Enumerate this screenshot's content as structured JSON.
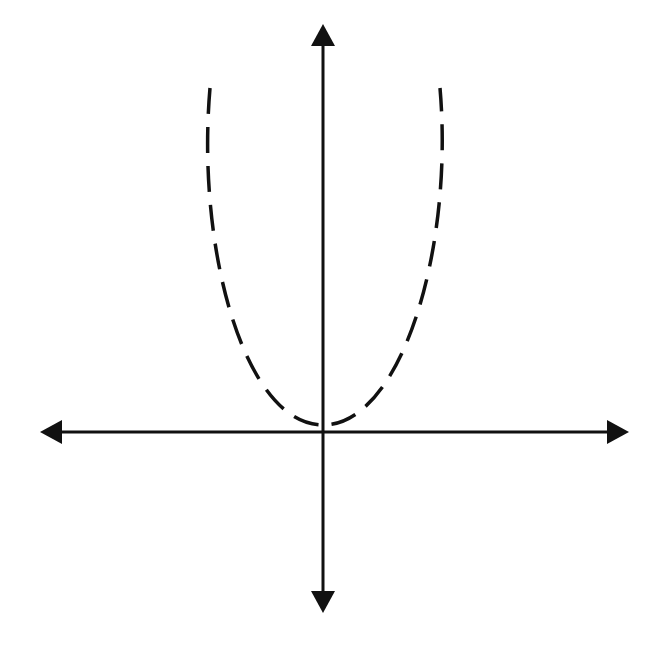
{
  "diagram": {
    "type": "coordinate-plane-graph",
    "colors": {
      "background": "#ffffff",
      "ink": "#111111"
    },
    "axes": {
      "x_axis": {
        "y": 432,
        "x_start": 40,
        "x_end": 628,
        "arrows": "both"
      },
      "y_axis": {
        "x": 323,
        "y_start": 25,
        "y_end": 612,
        "arrows": "both"
      }
    },
    "curve": {
      "shape": "parabola",
      "style": "dashed",
      "opens": "up",
      "vertex": [
        323,
        425
      ],
      "left_end": [
        210,
        88
      ],
      "right_end": [
        440,
        88
      ]
    }
  }
}
